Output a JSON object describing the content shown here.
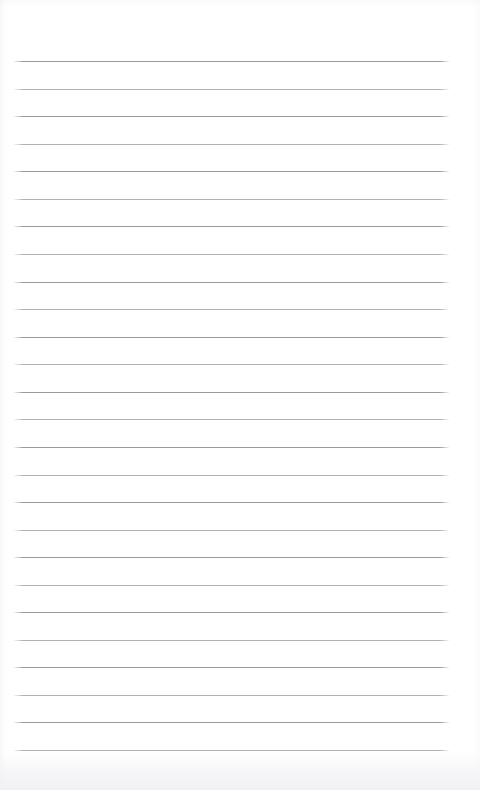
{
  "document": {
    "kind": "blank-lined-notepad-page",
    "page_width": 480,
    "page_height": 790,
    "background_color": "#ffffff",
    "content_text": "",
    "has_header": false,
    "has_footer": false,
    "has_page_number": false,
    "has_margin_rule": false,
    "has_punch_holes": false
  },
  "ruling": {
    "line_color": "#9a9a9a",
    "line_color_alternate": "#b2b2b2",
    "line_thickness_px": 1,
    "line_left_px": 13,
    "line_right_px": 450,
    "line_width_px": 437,
    "first_line_y_px": 61,
    "last_line_y_px": 750,
    "line_spacing_px": 27.56,
    "line_count": 26,
    "lines": [
      {
        "index": 1,
        "y": 61,
        "alt": false
      },
      {
        "index": 2,
        "y": 89,
        "alt": true
      },
      {
        "index": 3,
        "y": 116,
        "alt": false
      },
      {
        "index": 4,
        "y": 144,
        "alt": true
      },
      {
        "index": 5,
        "y": 171,
        "alt": false
      },
      {
        "index": 6,
        "y": 199,
        "alt": true
      },
      {
        "index": 7,
        "y": 226,
        "alt": false
      },
      {
        "index": 8,
        "y": 254,
        "alt": true
      },
      {
        "index": 9,
        "y": 282,
        "alt": false
      },
      {
        "index": 10,
        "y": 309,
        "alt": true
      },
      {
        "index": 11,
        "y": 337,
        "alt": false
      },
      {
        "index": 12,
        "y": 364,
        "alt": true
      },
      {
        "index": 13,
        "y": 392,
        "alt": false
      },
      {
        "index": 14,
        "y": 419,
        "alt": true
      },
      {
        "index": 15,
        "y": 447,
        "alt": false
      },
      {
        "index": 16,
        "y": 475,
        "alt": true
      },
      {
        "index": 17,
        "y": 502,
        "alt": false
      },
      {
        "index": 18,
        "y": 530,
        "alt": true
      },
      {
        "index": 19,
        "y": 557,
        "alt": false
      },
      {
        "index": 20,
        "y": 585,
        "alt": true
      },
      {
        "index": 21,
        "y": 612,
        "alt": false
      },
      {
        "index": 22,
        "y": 640,
        "alt": true
      },
      {
        "index": 23,
        "y": 667,
        "alt": false
      },
      {
        "index": 24,
        "y": 695,
        "alt": true
      },
      {
        "index": 25,
        "y": 722,
        "alt": false
      },
      {
        "index": 26,
        "y": 750,
        "alt": true
      }
    ]
  },
  "margins": {
    "top_px": 61,
    "left_px": 13,
    "right_px": 30,
    "bottom_px": 40
  }
}
